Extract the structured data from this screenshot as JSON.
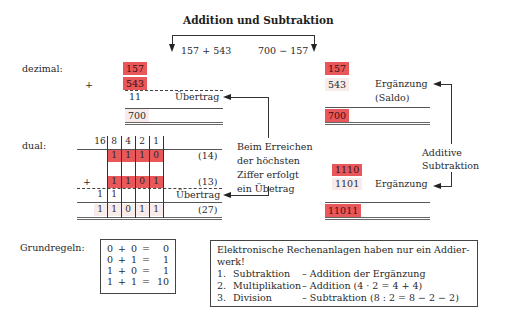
{
  "title": "Addition und Subtraktion",
  "header_equations": {
    "addition": "157 + 543",
    "subtraktion": "700 − 157"
  },
  "decimal": {
    "label": "dezimal:",
    "plus": "+",
    "addition": {
      "operand1": "157",
      "operand2": "543",
      "carry": "11",
      "carry_label": "Übertrag",
      "result": "700"
    },
    "subtraction": {
      "operand1": "157",
      "operand2": "543",
      "complement_label": "Ergänzung",
      "complement_sub": "(Saldo)",
      "result": "700"
    }
  },
  "binary": {
    "label": "dual:",
    "plus": "+",
    "place_values": [
      "16",
      "8",
      "4",
      "2",
      "1"
    ],
    "row1": {
      "digits": [
        "",
        "1",
        "1",
        "1",
        "0"
      ],
      "decimal": "(14)"
    },
    "row2": {
      "digits": [
        "",
        "1",
        "1",
        "0",
        "1"
      ],
      "decimal": "(13)"
    },
    "carry": {
      "digits": [
        "1",
        "1",
        "",
        "",
        ""
      ],
      "label": "Übertrag"
    },
    "result": {
      "digits": [
        "1",
        "1",
        "0",
        "1",
        "1"
      ],
      "decimal": "(27)"
    },
    "subtraction": {
      "operand1": "1110",
      "operand2": "1101",
      "complement_label": "Ergänzung",
      "result": "11011"
    }
  },
  "annotations": {
    "carry_note": [
      "Beim Erreichen",
      "der höchsten",
      "Ziffer erfolgt",
      "ein Übetrag"
    ],
    "additive_subtraction": [
      "Additive",
      "Subtraktion"
    ]
  },
  "rules": {
    "label": "Grundregeln:",
    "items": [
      {
        "a": "0",
        "op": "+",
        "b": "0",
        "eq": "=",
        "r": "0"
      },
      {
        "a": "0",
        "op": "+",
        "b": "1",
        "eq": "=",
        "r": "1"
      },
      {
        "a": "1",
        "op": "+",
        "b": "0",
        "eq": "=",
        "r": "1"
      },
      {
        "a": "1",
        "op": "+",
        "b": "1",
        "eq": "=",
        "r": "10"
      }
    ]
  },
  "info_box": {
    "heading_line1": "Elektronische Rechenanlagen haben nur ein Addier-",
    "heading_line2": "werk!",
    "items": [
      {
        "num": "1.",
        "op": "Subtraktion",
        "desc": "– Addition der Ergänzung"
      },
      {
        "num": "2.",
        "op": "Multiplikation",
        "desc": "– Addition (4 · 2 = 4 + 4)"
      },
      {
        "num": "3.",
        "op": "Division",
        "desc": "– Subtraktion (8 : 2 = 8 − 2 − 2)"
      }
    ]
  },
  "colors": {
    "highlight": "#e8575a",
    "highlight_light": "#f3d4d2",
    "pale": "#f7ecea",
    "ink": "#2a2a2a"
  }
}
